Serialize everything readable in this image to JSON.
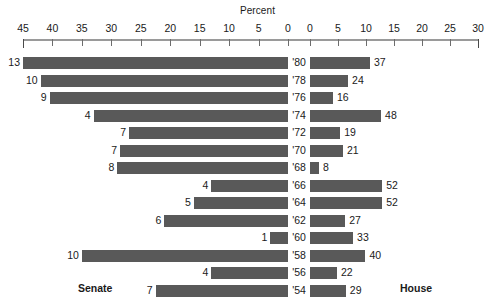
{
  "chart_data": {
    "type": "bar",
    "title": "Percent",
    "subtitle": "",
    "xlabel": "Percent",
    "ylabel": "",
    "orientation": "horizontal",
    "layout": "diverging-bidirectional",
    "grid": false,
    "legend_position": "none",
    "left_panel_label": "Senate",
    "right_panel_label": "House",
    "left_axis_ticks": [
      45,
      40,
      35,
      30,
      25,
      20,
      15,
      10,
      5,
      0
    ],
    "right_axis_ticks": [
      0,
      5,
      10,
      15,
      20,
      25,
      30
    ],
    "left_xlim": [
      45,
      0
    ],
    "right_xlim": [
      0,
      30
    ],
    "categories": [
      "'80",
      "'78",
      "'76",
      "'74",
      "'72",
      "'70",
      "'68",
      "'66",
      "'64",
      "'62",
      "'60",
      "'58",
      "'56",
      "'54"
    ],
    "series": [
      {
        "name": "Senate",
        "side": "left",
        "value_labels": [
          13,
          10,
          9,
          4,
          7,
          7,
          8,
          4,
          5,
          6,
          1,
          10,
          4,
          7
        ],
        "percent_values": [
          45.0,
          42.0,
          40.5,
          33.0,
          27.0,
          28.5,
          29.0,
          13.0,
          16.0,
          21.0,
          3.0,
          35.0,
          13.0,
          22.5
        ]
      },
      {
        "name": "House",
        "side": "right",
        "value_labels": [
          37,
          24,
          16,
          48,
          19,
          21,
          8,
          52,
          52,
          27,
          33,
          40,
          22,
          29
        ],
        "percent_values": [
          10.7,
          6.8,
          4.1,
          12.7,
          5.4,
          5.9,
          1.6,
          12.9,
          12.9,
          6.3,
          7.7,
          9.9,
          4.8,
          6.4
        ]
      }
    ],
    "colors": {
      "bar": "#595959",
      "axis": "#9a9a9a",
      "text": "#1a1a1a",
      "background": "#ffffff"
    }
  }
}
